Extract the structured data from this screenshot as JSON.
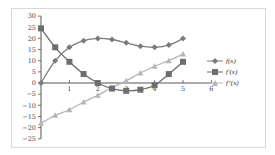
{
  "chart_data": {
    "type": "line",
    "title": "",
    "xlabel": "",
    "ylabel": "",
    "x": [
      0,
      0.5,
      1,
      1.5,
      2,
      2.5,
      3,
      3.5,
      4,
      4.5,
      5
    ],
    "xlim": [
      0,
      6
    ],
    "ylim": [
      -25,
      30
    ],
    "x_ticks": [
      1,
      2,
      3,
      4,
      5,
      6
    ],
    "y_ticks": [
      30,
      25,
      20,
      15,
      10,
      5,
      0,
      -5,
      -10,
      -15,
      -20,
      -25
    ],
    "grid": false,
    "legend_position": "right",
    "series": [
      {
        "name": "f(x)",
        "marker": "diamond",
        "color": "#7a7a7a",
        "values": [
          0,
          10,
          16,
          19,
          20,
          19.5,
          18,
          16.5,
          16,
          17,
          20
        ]
      },
      {
        "name": "f′(x)",
        "marker": "square",
        "color": "#6e6e6e",
        "values": [
          24.5,
          16,
          9.5,
          4,
          0,
          -2.5,
          -3.5,
          -3,
          -1,
          4,
          9.5
        ]
      },
      {
        "name": "f″(x)",
        "marker": "triangle",
        "color": "#b5b5b5",
        "values": [
          -18,
          -14.5,
          -12,
          -8.5,
          -5.5,
          -2,
          1,
          4.5,
          7.5,
          10,
          13
        ]
      }
    ]
  },
  "legend": {
    "items": [
      "f(x)",
      "f′(x)",
      "f″(x)"
    ]
  }
}
